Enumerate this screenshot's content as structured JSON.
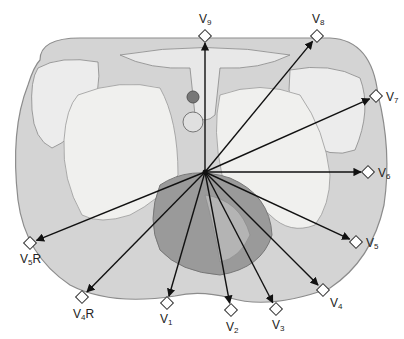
{
  "diagram": {
    "center": {
      "x": 205,
      "y": 172
    },
    "colors": {
      "body_fill": "#d4d4d4",
      "body_outline": "#8c8c8c",
      "lung_fill": "#f0f0ee",
      "heart_fill": "#9a9a9a",
      "heart_inner": "#b4b4b4",
      "bone_fill": "#ececec",
      "arrow": "#111111",
      "electrode_fill": "#ffffff",
      "electrode_stroke": "#333333"
    },
    "leads": [
      {
        "id": "V9",
        "base": "V",
        "sub": "9",
        "suffix": "",
        "electrode": {
          "x": 205,
          "y": 36
        },
        "label": {
          "x": 199,
          "y": 13
        }
      },
      {
        "id": "V8",
        "base": "V",
        "sub": "8",
        "suffix": "",
        "electrode": {
          "x": 317,
          "y": 36
        },
        "label": {
          "x": 312,
          "y": 13
        }
      },
      {
        "id": "V7",
        "base": "V",
        "sub": "7",
        "suffix": "",
        "electrode": {
          "x": 376,
          "y": 96
        },
        "label": {
          "x": 386,
          "y": 91
        }
      },
      {
        "id": "V6",
        "base": "V",
        "sub": "6",
        "suffix": "",
        "electrode": {
          "x": 368,
          "y": 172
        },
        "label": {
          "x": 378,
          "y": 167
        }
      },
      {
        "id": "V5",
        "base": "V",
        "sub": "5",
        "suffix": "",
        "electrode": {
          "x": 356,
          "y": 242
        },
        "label": {
          "x": 366,
          "y": 237
        }
      },
      {
        "id": "V4",
        "base": "V",
        "sub": "4",
        "suffix": "",
        "electrode": {
          "x": 323,
          "y": 290
        },
        "label": {
          "x": 330,
          "y": 297
        }
      },
      {
        "id": "V3",
        "base": "V",
        "sub": "3",
        "suffix": "",
        "electrode": {
          "x": 276,
          "y": 309
        },
        "label": {
          "x": 272,
          "y": 319
        }
      },
      {
        "id": "V2",
        "base": "V",
        "sub": "2",
        "suffix": "",
        "electrode": {
          "x": 231,
          "y": 310
        },
        "label": {
          "x": 226,
          "y": 321
        }
      },
      {
        "id": "V1",
        "base": "V",
        "sub": "1",
        "suffix": "",
        "electrode": {
          "x": 167,
          "y": 303
        },
        "label": {
          "x": 160,
          "y": 313
        }
      },
      {
        "id": "V4R",
        "base": "V",
        "sub": "4",
        "suffix": "R",
        "electrode": {
          "x": 82,
          "y": 297
        },
        "label": {
          "x": 73,
          "y": 308
        }
      },
      {
        "id": "V5R",
        "base": "V",
        "sub": "5",
        "suffix": "R",
        "electrode": {
          "x": 30,
          "y": 243
        },
        "label": {
          "x": 20,
          "y": 253
        }
      }
    ]
  }
}
